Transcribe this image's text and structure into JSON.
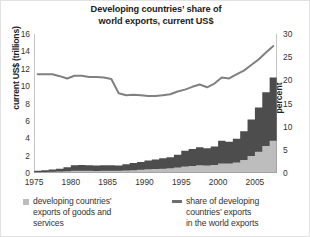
{
  "chart_data": {
    "type": "area",
    "title": "Developing countries’ share of world exports, current US$",
    "title_line1": "Developing countries’ share of",
    "title_line2": "world exports, current US$",
    "xlabel": "",
    "ylabel": "current US$ (trillions)",
    "ylabel_right": "percent",
    "grid": false,
    "legend_position": "bottom",
    "xlim": [
      1975,
      2007
    ],
    "ylim": [
      0,
      16
    ],
    "ylim_right": [
      0,
      30
    ],
    "xticks": [
      1975,
      1980,
      1985,
      1990,
      1995,
      2000,
      2005
    ],
    "xtick_labels": [
      "1975",
      "1980",
      "1985",
      "1990",
      "1995",
      "2000",
      "2005"
    ],
    "yticks": [
      0,
      2,
      4,
      6,
      8,
      10,
      12,
      14,
      16
    ],
    "ytick_labels": [
      "0",
      "2",
      "4",
      "6",
      "8",
      "10",
      "12",
      "14",
      "16"
    ],
    "yticks_right": [
      0,
      5,
      10,
      15,
      20,
      25,
      30
    ],
    "ytick_labels_right": [
      "0",
      "5",
      "10",
      "15",
      "20",
      "25",
      "30"
    ],
    "x": [
      1975,
      1976,
      1977,
      1978,
      1979,
      1980,
      1981,
      1982,
      1983,
      1984,
      1985,
      1986,
      1987,
      1988,
      1989,
      1990,
      1991,
      1992,
      1993,
      1994,
      1995,
      1996,
      1997,
      1998,
      1999,
      2000,
      2001,
      2002,
      2003,
      2004,
      2005,
      2006,
      2007
    ],
    "series": [
      {
        "name": "developing countries’ exports of goods and services",
        "type": "area",
        "axis": "left",
        "units": "trillions of current US$",
        "color": "#4d4d4d",
        "values": [
          0.25,
          0.32,
          0.4,
          0.48,
          0.66,
          0.9,
          0.93,
          0.88,
          0.86,
          0.9,
          0.88,
          0.86,
          1.0,
          1.15,
          1.28,
          1.45,
          1.55,
          1.7,
          1.82,
          2.1,
          2.55,
          2.75,
          2.95,
          2.85,
          3.05,
          3.7,
          3.6,
          3.95,
          4.8,
          6.15,
          7.55,
          9.3,
          11.0
        ]
      },
      {
        "name": "lower band",
        "type": "area",
        "axis": "left",
        "units": "trillions of current US$",
        "color": "#bdbdbd",
        "values": [
          0.1,
          0.12,
          0.14,
          0.16,
          0.2,
          0.25,
          0.26,
          0.25,
          0.24,
          0.25,
          0.25,
          0.25,
          0.28,
          0.32,
          0.36,
          0.42,
          0.45,
          0.5,
          0.54,
          0.62,
          0.75,
          0.82,
          0.88,
          0.86,
          0.92,
          1.1,
          1.1,
          1.22,
          1.5,
          1.95,
          2.45,
          3.1,
          3.7
        ]
      },
      {
        "name": "share of developing countries’ exports in the world exports",
        "type": "line",
        "axis": "right",
        "units": "percent",
        "color": "#808080",
        "values": [
          21.3,
          21.3,
          21.3,
          20.9,
          20.4,
          21.0,
          21.0,
          20.7,
          20.7,
          20.6,
          20.3,
          17.2,
          16.8,
          16.9,
          16.8,
          16.6,
          16.6,
          16.8,
          17.0,
          17.6,
          18.0,
          18.6,
          19.1,
          18.5,
          19.3,
          20.6,
          20.4,
          21.3,
          22.1,
          23.3,
          24.5,
          26.0,
          27.4
        ]
      }
    ]
  },
  "legend": {
    "items": [
      {
        "marker": "square-swatch",
        "color": "#bdbdbd",
        "line1": "developing countries’",
        "line2": "exports of goods and",
        "line3": "services"
      },
      {
        "marker": "line-swatch",
        "color": "#6e6e6e",
        "line1": "share of developing",
        "line2": "countries’ exports",
        "line3": "in the world exports"
      }
    ]
  }
}
